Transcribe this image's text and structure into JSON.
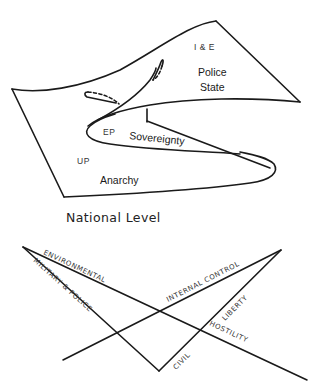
{
  "surface": {
    "regions": {
      "ie": "I & E",
      "police_state_line1": "Police",
      "police_state_line2": "State",
      "ep": "EP",
      "sovereignty": "Sovereignty",
      "up": "UP",
      "anarchy": "Anarchy"
    },
    "caption": "National Level"
  },
  "axes": {
    "environmental": "ENVIRONMENTAL",
    "military_police": "MILITARY & POLICE",
    "internal_control": "INTERNAL CONTROL",
    "civil": "CIVIL",
    "liberty": "LIBERTY",
    "hostility": "HOSTILITY"
  }
}
